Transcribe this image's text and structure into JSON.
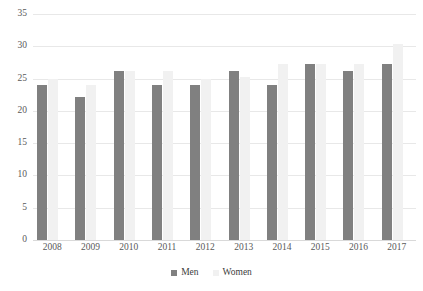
{
  "chart_data": {
    "type": "bar",
    "title": "",
    "subtitle": "",
    "xlabel": "",
    "ylabel": "",
    "categories": [
      "2008",
      "2009",
      "2010",
      "2011",
      "2012",
      "2013",
      "2014",
      "2015",
      "2016",
      "2017"
    ],
    "series": [
      {
        "name": "Men",
        "color": "#808080",
        "values": [
          24.0,
          22.2,
          26.2,
          24.0,
          24.0,
          26.2,
          24.0,
          27.2,
          26.2,
          27.2
        ]
      },
      {
        "name": "Women",
        "color": "#f1f1f1",
        "values": [
          25.0,
          24.0,
          26.2,
          26.2,
          25.0,
          25.3,
          27.2,
          27.2,
          27.2,
          30.3
        ]
      }
    ],
    "ylim": [
      0,
      35
    ],
    "yticks": [
      0,
      5,
      10,
      15,
      20,
      25,
      30,
      35
    ],
    "ytick_labels": [
      "0",
      "5",
      "10",
      "15",
      "20",
      "25",
      "30",
      "35"
    ],
    "grid": true,
    "grid_axis": "y",
    "legend_position": "bottom"
  },
  "legend": {
    "items": [
      {
        "label": "Men",
        "color": "#808080"
      },
      {
        "label": "Women",
        "color": "#f1f1f1"
      }
    ]
  }
}
